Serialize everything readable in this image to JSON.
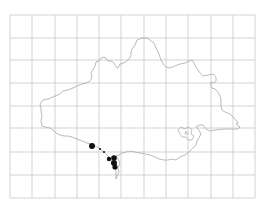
{
  "map": {
    "type": "distribution-map",
    "grid": {
      "x_lines": [
        10,
        32,
        55,
        77,
        99,
        121,
        144,
        166,
        188,
        211,
        233,
        255
      ],
      "y_lines": [
        15,
        38,
        60,
        83,
        106,
        128,
        152,
        175,
        198
      ],
      "color": "#c8c8c8"
    },
    "outline_color": "#a8a8a8",
    "dot_color": "#111111",
    "records": [
      {
        "x": 92,
        "y": 146,
        "r": 3.0
      },
      {
        "x": 100,
        "y": 149,
        "r": 1.0
      },
      {
        "x": 104,
        "y": 152,
        "r": 1.0
      },
      {
        "x": 109,
        "y": 159,
        "r": 2.2
      },
      {
        "x": 114,
        "y": 158,
        "r": 2.8
      },
      {
        "x": 114,
        "y": 163,
        "r": 3.0
      },
      {
        "x": 115,
        "y": 167,
        "r": 2.6
      }
    ]
  }
}
